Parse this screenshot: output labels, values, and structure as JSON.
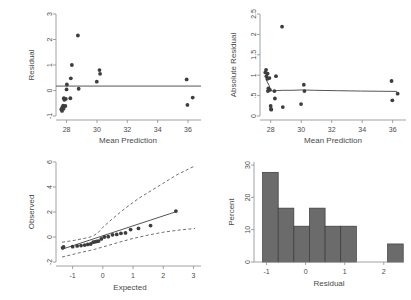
{
  "figure": {
    "layout": "2x2 panel grid of regression diagnostic plots",
    "background_color": "#ffffff",
    "marker_color": "#3d3d3d",
    "line_color": "#555555",
    "bar_fill_color": "#6b6b6b",
    "bar_edge_color": "#3a3a3a",
    "axis_color": "#8a8a8a"
  },
  "chart_data": [
    {
      "type": "scatter",
      "panel": "top-left",
      "title": "",
      "xlabel": "Mean Prediction",
      "ylabel": "Residual",
      "xlim": [
        27.4,
        37.0
      ],
      "ylim": [
        -1.35,
        3.25
      ],
      "xticks": [
        28,
        30,
        32,
        34,
        36
      ],
      "xtick_labels": [
        "28",
        "30",
        "32",
        "34",
        "36"
      ],
      "yticks": [
        -1,
        0,
        1,
        2,
        3
      ],
      "ytick_labels": [
        "-1",
        "0",
        "1",
        "2",
        "3"
      ],
      "grid": false,
      "reference_line": {
        "type": "horizontal",
        "y": 0,
        "style": "solid"
      },
      "points": [
        {
          "x": 27.75,
          "y": -1.05
        },
        {
          "x": 27.8,
          "y": -1.12
        },
        {
          "x": 27.82,
          "y": -0.95
        },
        {
          "x": 27.88,
          "y": -0.88
        },
        {
          "x": 27.9,
          "y": -1.02
        },
        {
          "x": 27.92,
          "y": -0.55
        },
        {
          "x": 27.95,
          "y": -0.62
        },
        {
          "x": 28.02,
          "y": -0.9
        },
        {
          "x": 28.05,
          "y": -0.58
        },
        {
          "x": 28.1,
          "y": -0.15
        },
        {
          "x": 28.12,
          "y": 0.07
        },
        {
          "x": 28.35,
          "y": -0.55
        },
        {
          "x": 28.38,
          "y": 0.35
        },
        {
          "x": 28.45,
          "y": 0.95
        },
        {
          "x": 28.85,
          "y": 2.28
        },
        {
          "x": 28.9,
          "y": -0.12
        },
        {
          "x": 30.1,
          "y": 0.2
        },
        {
          "x": 30.28,
          "y": 0.72
        },
        {
          "x": 30.32,
          "y": 0.55
        },
        {
          "x": 36.05,
          "y": 0.3
        },
        {
          "x": 36.1,
          "y": -0.85
        },
        {
          "x": 36.45,
          "y": -0.52
        }
      ]
    },
    {
      "type": "scatter",
      "panel": "top-right",
      "title": "",
      "xlabel": "Mean Prediction",
      "ylabel": "Absolute Residual",
      "xlim": [
        27.4,
        37.0
      ],
      "ylim": [
        -0.12,
        2.62
      ],
      "xticks": [
        28,
        30,
        32,
        34,
        36
      ],
      "xtick_labels": [
        "28",
        "30",
        "32",
        "34",
        "36"
      ],
      "yticks": [
        0,
        0.5,
        1,
        1.5,
        2,
        2.5
      ],
      "ytick_labels": [
        "0",
        ".5",
        "1",
        "1.5",
        "2",
        "2.5"
      ],
      "grid": false,
      "smoother": {
        "name": "lowess",
        "style": "solid",
        "x": [
          27.8,
          28.0,
          28.1,
          28.2,
          28.4,
          28.9,
          29.5,
          30.2,
          31.0,
          32.5,
          34.0,
          36.4
        ],
        "y": [
          0.86,
          0.7,
          0.58,
          0.55,
          0.56,
          0.57,
          0.57,
          0.58,
          0.57,
          0.56,
          0.55,
          0.54
        ]
      },
      "points": [
        {
          "x": 27.75,
          "y": 1.05
        },
        {
          "x": 27.8,
          "y": 1.12
        },
        {
          "x": 27.82,
          "y": 0.95
        },
        {
          "x": 27.88,
          "y": 0.88
        },
        {
          "x": 27.9,
          "y": 1.02
        },
        {
          "x": 27.92,
          "y": 0.55
        },
        {
          "x": 27.95,
          "y": 0.62
        },
        {
          "x": 28.02,
          "y": 0.9
        },
        {
          "x": 28.05,
          "y": 0.58
        },
        {
          "x": 28.1,
          "y": 0.15
        },
        {
          "x": 28.12,
          "y": 0.07
        },
        {
          "x": 28.14,
          "y": 0.05
        },
        {
          "x": 28.35,
          "y": 0.55
        },
        {
          "x": 28.38,
          "y": 0.35
        },
        {
          "x": 28.45,
          "y": 0.95
        },
        {
          "x": 28.85,
          "y": 2.28
        },
        {
          "x": 28.9,
          "y": 0.12
        },
        {
          "x": 30.1,
          "y": 0.2
        },
        {
          "x": 30.28,
          "y": 0.72
        },
        {
          "x": 30.32,
          "y": 0.55
        },
        {
          "x": 36.05,
          "y": 0.82
        },
        {
          "x": 36.1,
          "y": 0.3
        },
        {
          "x": 36.45,
          "y": 0.48
        }
      ]
    },
    {
      "type": "scatter",
      "panel": "bottom-left",
      "title": "",
      "xlabel": "Expected",
      "ylabel": "Observed",
      "xlim": [
        -1.55,
        3.25
      ],
      "ylim": [
        -2.4,
        6.6
      ],
      "xticks": [
        -1,
        0,
        1,
        2,
        3
      ],
      "xtick_labels": [
        "-1",
        "0",
        "1",
        "2",
        "3"
      ],
      "yticks": [
        -2,
        0,
        2,
        4,
        6
      ],
      "ytick_labels": [
        "-2",
        "0",
        "2",
        "4",
        "6"
      ],
      "grid": false,
      "reference_line": {
        "type": "diagonal",
        "style": "solid",
        "x": [
          -1.35,
          2.45
        ],
        "y": [
          -1.25,
          2.15
        ]
      },
      "confidence_bands": [
        {
          "name": "upper",
          "style": "dashed",
          "x": [
            -1.35,
            -1.0,
            -0.7,
            -0.45,
            -0.3,
            -0.15,
            0.0,
            0.3,
            0.7,
            1.2,
            1.8,
            2.45,
            3.05
          ],
          "y": [
            -0.62,
            -0.48,
            -0.32,
            -0.18,
            -0.02,
            0.25,
            0.72,
            1.45,
            2.35,
            3.35,
            4.35,
            5.45,
            6.25
          ]
        },
        {
          "name": "lower",
          "style": "dashed",
          "x": [
            -1.35,
            -1.0,
            -0.7,
            -0.45,
            -0.3,
            0.0,
            0.5,
            1.0,
            1.5,
            2.0,
            2.45,
            3.05
          ],
          "y": [
            -1.95,
            -1.72,
            -1.52,
            -1.38,
            -1.28,
            -1.05,
            -0.65,
            -0.28,
            0.02,
            0.28,
            0.45,
            0.62
          ]
        }
      ],
      "points": [
        {
          "x": -1.33,
          "y": -1.12
        },
        {
          "x": -1.3,
          "y": -1.05
        },
        {
          "x": -1.0,
          "y": -1.02
        },
        {
          "x": -0.85,
          "y": -0.95
        },
        {
          "x": -0.72,
          "y": -0.92
        },
        {
          "x": -0.6,
          "y": -0.88
        },
        {
          "x": -0.5,
          "y": -0.82
        },
        {
          "x": -0.4,
          "y": -0.78
        },
        {
          "x": -0.32,
          "y": -0.62
        },
        {
          "x": -0.26,
          "y": -0.58
        },
        {
          "x": -0.2,
          "y": -0.55
        },
        {
          "x": -0.14,
          "y": -0.52
        },
        {
          "x": -0.05,
          "y": -0.32
        },
        {
          "x": 0.05,
          "y": -0.15
        },
        {
          "x": 0.18,
          "y": -0.12
        },
        {
          "x": 0.32,
          "y": 0.05
        },
        {
          "x": 0.46,
          "y": 0.08
        },
        {
          "x": 0.6,
          "y": 0.18
        },
        {
          "x": 0.75,
          "y": 0.22
        },
        {
          "x": 0.92,
          "y": 0.52
        },
        {
          "x": 1.18,
          "y": 0.62
        },
        {
          "x": 1.58,
          "y": 0.88
        },
        {
          "x": 2.42,
          "y": 2.18
        }
      ]
    },
    {
      "type": "bar",
      "subtype": "histogram",
      "panel": "bottom-right",
      "title": "",
      "xlabel": "Residual",
      "ylabel": "Percent",
      "xlim": [
        -1.32,
        2.52
      ],
      "ylim": [
        0,
        31
      ],
      "xticks": [
        -1,
        0,
        1,
        2
      ],
      "xtick_labels": [
        "-1",
        "0",
        "1",
        "2"
      ],
      "yticks": [
        0,
        10,
        20,
        30
      ],
      "ytick_labels": [
        "0",
        "10",
        "20",
        "30"
      ],
      "grid": false,
      "bin_width": 0.4,
      "bins": [
        {
          "left": -1.1,
          "right": -0.7,
          "value": 27.8
        },
        {
          "left": -0.7,
          "right": -0.3,
          "value": 16.7
        },
        {
          "left": -0.3,
          "right": 0.1,
          "value": 11.1
        },
        {
          "left": 0.1,
          "right": 0.5,
          "value": 16.7
        },
        {
          "left": 0.5,
          "right": 0.9,
          "value": 11.1
        },
        {
          "left": 0.9,
          "right": 1.3,
          "value": 11.1
        },
        {
          "left": 2.1,
          "right": 2.5,
          "value": 5.6
        }
      ],
      "categories": [
        "-1.1 to -0.7",
        "-0.7 to -0.3",
        "-0.3 to 0.1",
        "0.1 to 0.5",
        "0.5 to 0.9",
        "0.9 to 1.3",
        "2.1 to 2.5"
      ],
      "values": [
        27.8,
        16.7,
        11.1,
        16.7,
        11.1,
        11.1,
        5.6
      ]
    }
  ]
}
